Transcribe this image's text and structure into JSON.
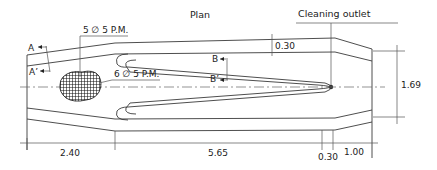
{
  "title": "Plan",
  "callouts": {
    "cleaning_outlet": "Cleaning outlet",
    "pm_upper": "5 ∅ 5 P.M.",
    "pm_lower": "6 ∅ 5 P.M."
  },
  "sections": {
    "a": "A",
    "a_prime": "A’",
    "b": "B",
    "b_prime": "B’"
  },
  "dimensions": {
    "wall_thickness": "0.30",
    "width": "1.69",
    "inlet_length": "2.40",
    "main_length": "5.65",
    "outlet_wall": "0.30",
    "outlet_length": "1.00"
  },
  "colors": {
    "line": "#3a3a3a",
    "background": "#ffffff"
  }
}
